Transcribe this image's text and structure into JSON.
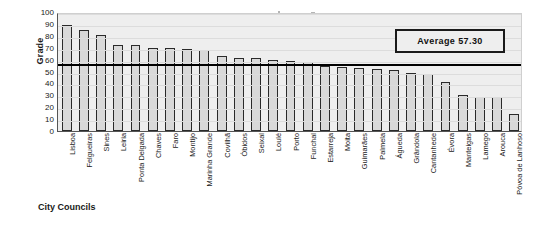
{
  "chart_data": {
    "type": "bar",
    "title": "",
    "xlabel": "City Councils",
    "ylabel": "Grade",
    "ylim": [
      0,
      100
    ],
    "yticks": [
      100,
      90,
      80,
      70,
      60,
      50,
      40,
      30,
      20,
      10,
      0
    ],
    "grid": true,
    "legend_position": "top-right",
    "categories": [
      "Lisboa",
      "Felgueiras",
      "Sines",
      "Leiria",
      "Ponta Delgada",
      "Chaves",
      "Faro",
      "Montijo",
      "Marinha Grande",
      "Covilhã",
      "Óbidos",
      "Seixal",
      "Loulé",
      "Porto",
      "Funchal",
      "Estarreja",
      "Moita",
      "Guimarães",
      "Palmela",
      "Águeda",
      "Grândola",
      "Cantanhede",
      "Évora",
      "Manteigas",
      "Lamego",
      "Arouca",
      "Póvoa de Lanhoso"
    ],
    "values": [
      89,
      85,
      81,
      72,
      72,
      70,
      70,
      69,
      68,
      63,
      61,
      61,
      60,
      59,
      58,
      55,
      54,
      53,
      52,
      51,
      49,
      48,
      41,
      30,
      29,
      29,
      14
    ],
    "annotations": [
      {
        "name": "average-line",
        "label": "Average 57.30",
        "value": 57.3
      }
    ]
  },
  "legend": {
    "average_label": "Average 57.30"
  },
  "axes": {
    "y_title": "Grade",
    "x_title": "City Councils"
  },
  "colors": {
    "bar_fill": "#d9d9d9",
    "bar_border": "#2a2a2a",
    "plot_background": "#eeeeee",
    "average_line": "#000000",
    "text": "#1a1a1a"
  }
}
